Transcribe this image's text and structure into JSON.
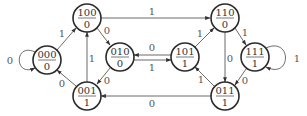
{
  "diagram": {
    "type": "state-machine",
    "states": [
      {
        "id": "s000",
        "code": "000",
        "output": "0",
        "cx": 47,
        "cy": 60
      },
      {
        "id": "s100",
        "code": "100",
        "output": "0",
        "cx": 87,
        "cy": 18
      },
      {
        "id": "s010",
        "code": "010",
        "output": "0",
        "cx": 120,
        "cy": 57
      },
      {
        "id": "s001",
        "code": "001",
        "output": "1",
        "cx": 87,
        "cy": 96
      },
      {
        "id": "s101",
        "code": "101",
        "output": "1",
        "cx": 185,
        "cy": 57
      },
      {
        "id": "s110",
        "code": "110",
        "output": "0",
        "cx": 225,
        "cy": 18
      },
      {
        "id": "s111",
        "code": "111",
        "output": "1",
        "cx": 255,
        "cy": 57
      },
      {
        "id": "s011",
        "code": "011",
        "output": "1",
        "cx": 225,
        "cy": 96
      }
    ],
    "transitions": [
      {
        "from": "000",
        "to": "000",
        "input": "0"
      },
      {
        "from": "000",
        "to": "100",
        "input": "1"
      },
      {
        "from": "100",
        "to": "110",
        "input": "1"
      },
      {
        "from": "100",
        "to": "010",
        "input": "0"
      },
      {
        "from": "010",
        "to": "001",
        "input": "0"
      },
      {
        "from": "010",
        "to": "101",
        "input": "1"
      },
      {
        "from": "101",
        "to": "010",
        "input": "0"
      },
      {
        "from": "101",
        "to": "110",
        "input": "1"
      },
      {
        "from": "001",
        "to": "100",
        "input": "1"
      },
      {
        "from": "001",
        "to": "000",
        "input": "0"
      },
      {
        "from": "110",
        "to": "011",
        "input": "0"
      },
      {
        "from": "110",
        "to": "111",
        "input": "1"
      },
      {
        "from": "111",
        "to": "111",
        "input": "1"
      },
      {
        "from": "111",
        "to": "011",
        "input": "0"
      },
      {
        "from": "011",
        "to": "101",
        "input": "1"
      },
      {
        "from": "011",
        "to": "001",
        "input": "0"
      }
    ]
  },
  "labels": {
    "s000": {
      "code": "000",
      "output": "0"
    },
    "s100": {
      "code": "100",
      "output": "0"
    },
    "s010": {
      "code": "010",
      "output": "0"
    },
    "s001": {
      "code": "001",
      "output": "1"
    },
    "s101": {
      "code": "101",
      "output": "1"
    },
    "s110": {
      "code": "110",
      "output": "0"
    },
    "s111": {
      "code": "111",
      "output": "1"
    },
    "s011": {
      "code": "011",
      "output": "1"
    },
    "edges": {
      "e000_000": "0",
      "e000_100": "1",
      "e100_110": "1",
      "e100_010": "0",
      "e010_001": "0",
      "e010_101": "1",
      "e101_010": "0",
      "e101_110": "1",
      "e001_100": "1",
      "e001_000": "0",
      "e110_011": "0",
      "e110_111": "1",
      "e111_111": "1",
      "e111_011": "0",
      "e011_101": "1",
      "e011_001": "0"
    }
  }
}
